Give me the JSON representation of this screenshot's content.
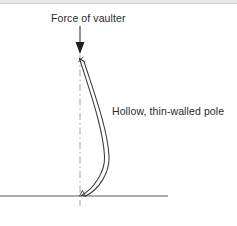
{
  "figure": {
    "background_color": "#ffffff",
    "width": 237,
    "height": 226
  },
  "labels": {
    "force": "Force of vaulter",
    "pole": "Hollow, thin-walled pole"
  },
  "colors": {
    "line": "#3a3a3a",
    "centerline": "#9a9a9a",
    "ground": "#5a5a5a",
    "text": "#2b2b2b",
    "top_band": "#e9e9e9"
  },
  "geometry": {
    "arrow": {
      "x": 80,
      "y_start": 26,
      "y_end": 53,
      "head_width": 9,
      "head_height": 11
    },
    "centerline": {
      "x": 80,
      "y_start": 55,
      "y_end": 206,
      "dash_pattern": "7 3 1.5 3"
    },
    "ground_line": {
      "x_start": 0,
      "x_end": 168,
      "y": 196
    },
    "pole": {
      "top_x": 79,
      "top_y": 57,
      "bottom_x": 82,
      "bottom_y": 196,
      "max_bow_x": 108,
      "wall_thickness": 4
    }
  }
}
